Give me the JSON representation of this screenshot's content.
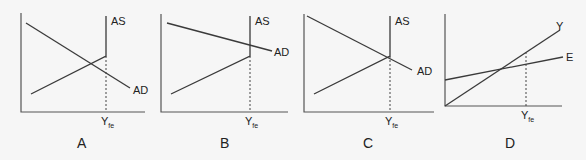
{
  "panels": [
    {
      "caption": "A",
      "supply_label": "AS",
      "demand_label": "AD",
      "x_marker": "Y",
      "x_marker_sub": "fe"
    },
    {
      "caption": "B",
      "supply_label": "AS",
      "demand_label": "AD",
      "x_marker": "Y",
      "x_marker_sub": "fe"
    },
    {
      "caption": "C",
      "supply_label": "AS",
      "demand_label": "AD",
      "x_marker": "Y",
      "x_marker_sub": "fe"
    },
    {
      "caption": "D",
      "line1_label": "Y",
      "line2_label": "E",
      "x_marker": "Y",
      "x_marker_sub": "fe"
    }
  ]
}
